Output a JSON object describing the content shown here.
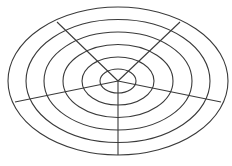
{
  "figure": {
    "name": "concentric-ellipse-radial-diagram",
    "width": 232,
    "height": 166,
    "background_color": "#ffffff",
    "line_color": "#3a3a3a",
    "line_width": 1.1,
    "center": {
      "x": 118,
      "y": 81
    }
  },
  "chart_data": {
    "type": "scatter",
    "subtitle": "",
    "xlabel": "",
    "ylabel": "",
    "grid": true,
    "legend": null,
    "center": {
      "x": 118,
      "y": 81
    },
    "ring_count": 6,
    "spoke_count": 5,
    "rings": [
      {
        "index": 1,
        "rx": 18,
        "ry": 12
      },
      {
        "index": 2,
        "rx": 36,
        "ry": 24
      },
      {
        "index": 3,
        "rx": 55,
        "ry": 36.5
      },
      {
        "index": 4,
        "rx": 74,
        "ry": 49
      },
      {
        "index": 5,
        "rx": 92,
        "ry": 61.5
      },
      {
        "index": 6,
        "rx": 110,
        "ry": 74
      }
    ],
    "spokes": [
      {
        "index": 1,
        "label": "upper-left",
        "angle_deg": 211,
        "end_x": 57,
        "end_y": 22
      },
      {
        "index": 2,
        "label": "upper-right",
        "angle_deg": 329,
        "end_x": 180,
        "end_y": 22
      },
      {
        "index": 3,
        "label": "lower-left",
        "angle_deg": 169,
        "end_x": 15,
        "end_y": 102
      },
      {
        "index": 4,
        "label": "lower-right",
        "angle_deg": 11,
        "end_x": 221,
        "end_y": 102
      },
      {
        "index": 5,
        "label": "down",
        "angle_deg": 90,
        "end_x": 118,
        "end_y": 155
      }
    ]
  }
}
